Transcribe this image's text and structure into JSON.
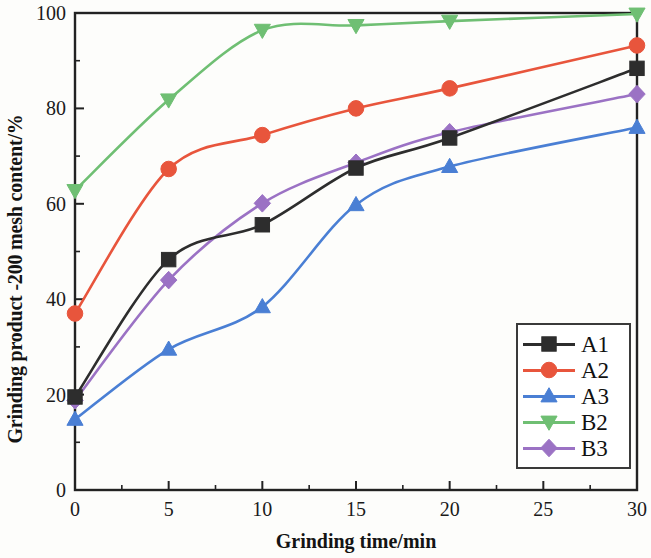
{
  "chart_data": {
    "type": "line",
    "title": "",
    "xlabel": "Grinding time/min",
    "ylabel": "Grinding product -200 mesh content/%",
    "xlim": [
      0,
      30
    ],
    "ylim": [
      0,
      100
    ],
    "xticks": [
      0,
      5,
      10,
      15,
      20,
      25,
      30
    ],
    "xtick_labels": [
      "0",
      "5",
      "10",
      "15",
      "20",
      "25",
      "30"
    ],
    "yticks": [
      0,
      20,
      40,
      60,
      80,
      100
    ],
    "ytick_labels": [
      "0",
      "20",
      "40",
      "60",
      "80",
      "100"
    ],
    "x_minor_tick_interval": 2.5,
    "y_minor_tick_interval": 10,
    "grid": false,
    "legend_position": "lower right",
    "x": [
      0,
      5,
      10,
      15,
      20,
      30
    ],
    "series": [
      {
        "name": "A1",
        "color": "#2d2d2d",
        "marker": "square",
        "values": [
          19.5,
          48.3,
          55.6,
          67.5,
          73.8,
          88.4
        ]
      },
      {
        "name": "A2",
        "color": "#e8553c",
        "marker": "circle",
        "values": [
          37.0,
          67.3,
          74.4,
          80.0,
          84.2,
          93.2
        ]
      },
      {
        "name": "A3",
        "color": "#4a7fd4",
        "marker": "triangle-up",
        "values": [
          14.8,
          29.5,
          38.4,
          59.8,
          67.8,
          76.0
        ]
      },
      {
        "name": "B2",
        "color": "#6fbf73",
        "marker": "triangle-down",
        "values": [
          62.8,
          81.8,
          96.4,
          97.4,
          98.3,
          99.8
        ]
      },
      {
        "name": "B3",
        "color": "#9b72c4",
        "marker": "diamond",
        "values": [
          18.8,
          44.0,
          60.1,
          68.6,
          75.0,
          83.0
        ]
      }
    ]
  },
  "legend": {
    "items": [
      {
        "label": "A1"
      },
      {
        "label": "A2"
      },
      {
        "label": "A3"
      },
      {
        "label": "B2"
      },
      {
        "label": "B3"
      }
    ]
  }
}
